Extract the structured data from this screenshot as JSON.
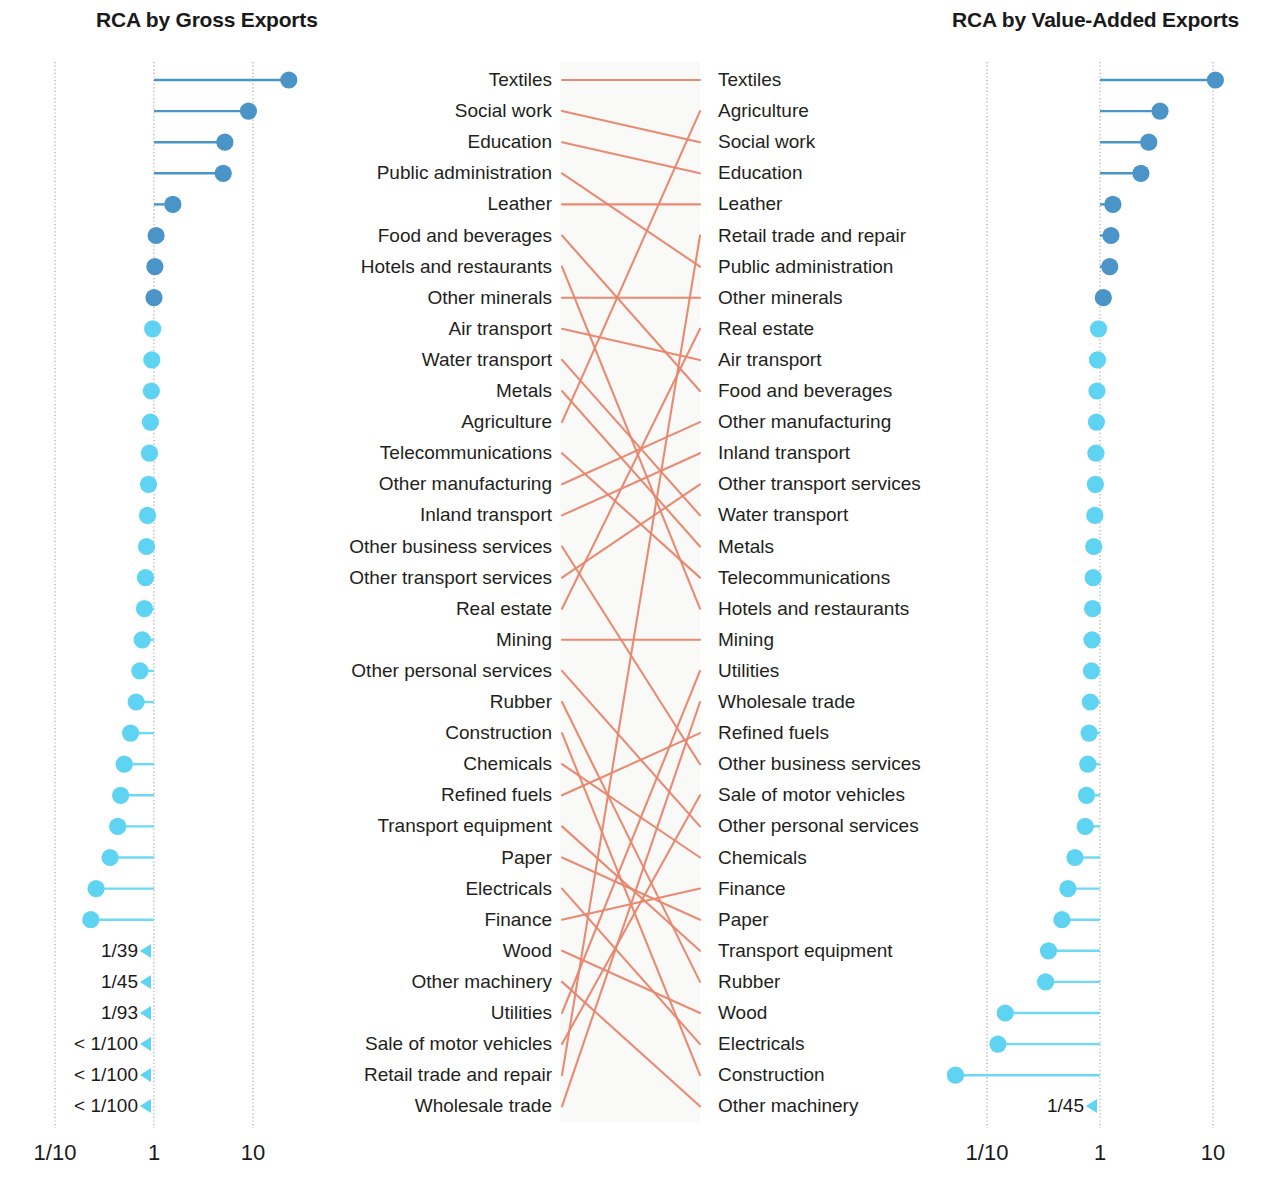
{
  "panels": {
    "left": {
      "title": "RCA by Gross Exports"
    },
    "right": {
      "title": "RCA by Value-Added Exports"
    }
  },
  "axis": {
    "ticks": [
      "1/10",
      "1",
      "10"
    ],
    "tick_values": [
      0.1,
      1,
      10
    ]
  },
  "colors": {
    "dot_high": "#4a94c8",
    "dot_low": "#5fd3f2",
    "line_high": "#4a94c8",
    "line_low": "#6fd8f5",
    "connector": "#e8856b",
    "gridline": "#9a9a9a",
    "text": "#231f20",
    "band": "#f4f4f2"
  },
  "chart_data": {
    "type": "slopegraph",
    "xlabel": "Revealed Comparative Advantage (log scale)",
    "ylabel": "",
    "xlim": [
      0.01,
      30
    ],
    "xticks": [
      0.1,
      1,
      10
    ],
    "xticklabels": [
      "1/10",
      "1",
      "10"
    ],
    "grid": true,
    "legend": "none",
    "baseline": 1,
    "off_scale_threshold": 0.01,
    "series": [
      {
        "name": "RCA by Gross Exports",
        "panel": "left",
        "points": [
          {
            "rank": 1,
            "label": "Textiles",
            "value": 23.0,
            "offscale": false,
            "high": true
          },
          {
            "rank": 2,
            "label": "Social work",
            "value": 9.0,
            "offscale": false,
            "high": true
          },
          {
            "rank": 3,
            "label": "Education",
            "value": 5.2,
            "offscale": false,
            "high": true
          },
          {
            "rank": 4,
            "label": "Public administration",
            "value": 5.0,
            "offscale": false,
            "high": true
          },
          {
            "rank": 5,
            "label": "Leather",
            "value": 1.55,
            "offscale": false,
            "high": true
          },
          {
            "rank": 6,
            "label": "Food and beverages",
            "value": 1.05,
            "offscale": false,
            "high": true
          },
          {
            "rank": 7,
            "label": "Hotels and restaurants",
            "value": 1.02,
            "offscale": false,
            "high": true
          },
          {
            "rank": 8,
            "label": "Other minerals",
            "value": 1.0,
            "offscale": false,
            "high": true
          },
          {
            "rank": 9,
            "label": "Air transport",
            "value": 0.97,
            "offscale": false,
            "high": false
          },
          {
            "rank": 10,
            "label": "Water transport",
            "value": 0.95,
            "offscale": false,
            "high": false
          },
          {
            "rank": 11,
            "label": "Metals",
            "value": 0.94,
            "offscale": false,
            "high": false
          },
          {
            "rank": 12,
            "label": "Agriculture",
            "value": 0.92,
            "offscale": false,
            "high": false
          },
          {
            "rank": 13,
            "label": "Telecommunications",
            "value": 0.9,
            "offscale": false,
            "high": false
          },
          {
            "rank": 14,
            "label": "Other manufacturing",
            "value": 0.88,
            "offscale": false,
            "high": false
          },
          {
            "rank": 15,
            "label": "Inland transport",
            "value": 0.86,
            "offscale": false,
            "high": false
          },
          {
            "rank": 16,
            "label": "Other business services",
            "value": 0.84,
            "offscale": false,
            "high": false
          },
          {
            "rank": 17,
            "label": "Other transport services",
            "value": 0.82,
            "offscale": false,
            "high": false
          },
          {
            "rank": 18,
            "label": "Real estate",
            "value": 0.8,
            "offscale": false,
            "high": false
          },
          {
            "rank": 19,
            "label": "Mining",
            "value": 0.76,
            "offscale": false,
            "high": false
          },
          {
            "rank": 20,
            "label": "Other personal services",
            "value": 0.72,
            "offscale": false,
            "high": false
          },
          {
            "rank": 21,
            "label": "Rubber",
            "value": 0.66,
            "offscale": false,
            "high": false
          },
          {
            "rank": 22,
            "label": "Construction",
            "value": 0.58,
            "offscale": false,
            "high": false
          },
          {
            "rank": 23,
            "label": "Chemicals",
            "value": 0.5,
            "offscale": false,
            "high": false
          },
          {
            "rank": 24,
            "label": "Refined fuels",
            "value": 0.46,
            "offscale": false,
            "high": false
          },
          {
            "rank": 25,
            "label": "Transport equipment",
            "value": 0.43,
            "offscale": false,
            "high": false
          },
          {
            "rank": 26,
            "label": "Paper",
            "value": 0.36,
            "offscale": false,
            "high": false
          },
          {
            "rank": 27,
            "label": "Electricals",
            "value": 0.26,
            "offscale": false,
            "high": false
          },
          {
            "rank": 28,
            "label": "Finance",
            "value": 0.23,
            "offscale": false,
            "high": false
          },
          {
            "rank": 29,
            "label": "Wood",
            "value": 0.0256,
            "offscale": true,
            "high": false,
            "offlabel": "1/39"
          },
          {
            "rank": 30,
            "label": "Other machinery",
            "value": 0.0222,
            "offscale": true,
            "high": false,
            "offlabel": "1/45"
          },
          {
            "rank": 31,
            "label": "Utilities",
            "value": 0.0108,
            "offscale": true,
            "high": false,
            "offlabel": "1/93"
          },
          {
            "rank": 32,
            "label": "Sale of motor vehicles",
            "value": 0.005,
            "offscale": true,
            "high": false,
            "offlabel": "< 1/100"
          },
          {
            "rank": 33,
            "label": "Retail trade and repair",
            "value": 0.005,
            "offscale": true,
            "high": false,
            "offlabel": "< 1/100"
          },
          {
            "rank": 34,
            "label": "Wholesale trade",
            "value": 0.005,
            "offscale": true,
            "high": false,
            "offlabel": "< 1/100"
          }
        ]
      },
      {
        "name": "RCA by Value-Added Exports",
        "panel": "right",
        "points": [
          {
            "rank": 1,
            "label": "Textiles",
            "value": 10.5,
            "offscale": false,
            "high": true
          },
          {
            "rank": 2,
            "label": "Agriculture",
            "value": 3.4,
            "offscale": false,
            "high": true
          },
          {
            "rank": 3,
            "label": "Social work",
            "value": 2.7,
            "offscale": false,
            "high": true
          },
          {
            "rank": 4,
            "label": "Education",
            "value": 2.3,
            "offscale": false,
            "high": true
          },
          {
            "rank": 5,
            "label": "Leather",
            "value": 1.3,
            "offscale": false,
            "high": true
          },
          {
            "rank": 6,
            "label": "Retail trade and repair",
            "value": 1.25,
            "offscale": false,
            "high": true
          },
          {
            "rank": 7,
            "label": "Public administration",
            "value": 1.22,
            "offscale": false,
            "high": true
          },
          {
            "rank": 8,
            "label": "Other minerals",
            "value": 1.07,
            "offscale": false,
            "high": true
          },
          {
            "rank": 9,
            "label": "Real estate",
            "value": 0.97,
            "offscale": false,
            "high": false
          },
          {
            "rank": 10,
            "label": "Air transport",
            "value": 0.95,
            "offscale": false,
            "high": false
          },
          {
            "rank": 11,
            "label": "Food and beverages",
            "value": 0.94,
            "offscale": false,
            "high": false
          },
          {
            "rank": 12,
            "label": "Other manufacturing",
            "value": 0.93,
            "offscale": false,
            "high": false
          },
          {
            "rank": 13,
            "label": "Inland transport",
            "value": 0.92,
            "offscale": false,
            "high": false
          },
          {
            "rank": 14,
            "label": "Other transport services",
            "value": 0.91,
            "offscale": false,
            "high": false
          },
          {
            "rank": 15,
            "label": "Water transport",
            "value": 0.9,
            "offscale": false,
            "high": false
          },
          {
            "rank": 16,
            "label": "Metals",
            "value": 0.88,
            "offscale": false,
            "high": false
          },
          {
            "rank": 17,
            "label": "Telecommunications",
            "value": 0.87,
            "offscale": false,
            "high": false
          },
          {
            "rank": 18,
            "label": "Hotels and restaurants",
            "value": 0.86,
            "offscale": false,
            "high": false
          },
          {
            "rank": 19,
            "label": "Mining",
            "value": 0.85,
            "offscale": false,
            "high": false
          },
          {
            "rank": 20,
            "label": "Utilities",
            "value": 0.84,
            "offscale": false,
            "high": false
          },
          {
            "rank": 21,
            "label": "Wholesale trade",
            "value": 0.82,
            "offscale": false,
            "high": false
          },
          {
            "rank": 22,
            "label": "Refined fuels",
            "value": 0.8,
            "offscale": false,
            "high": false
          },
          {
            "rank": 23,
            "label": "Other business services",
            "value": 0.78,
            "offscale": false,
            "high": false
          },
          {
            "rank": 24,
            "label": "Sale of motor vehicles",
            "value": 0.76,
            "offscale": false,
            "high": false
          },
          {
            "rank": 25,
            "label": "Other personal services",
            "value": 0.74,
            "offscale": false,
            "high": false
          },
          {
            "rank": 26,
            "label": "Chemicals",
            "value": 0.6,
            "offscale": false,
            "high": false
          },
          {
            "rank": 27,
            "label": "Finance",
            "value": 0.52,
            "offscale": false,
            "high": false
          },
          {
            "rank": 28,
            "label": "Paper",
            "value": 0.46,
            "offscale": false,
            "high": false
          },
          {
            "rank": 29,
            "label": "Transport equipment",
            "value": 0.35,
            "offscale": false,
            "high": false
          },
          {
            "rank": 30,
            "label": "Rubber",
            "value": 0.33,
            "offscale": false,
            "high": false
          },
          {
            "rank": 31,
            "label": "Wood",
            "value": 0.145,
            "offscale": false,
            "high": false
          },
          {
            "rank": 32,
            "label": "Electricals",
            "value": 0.125,
            "offscale": false,
            "high": false
          },
          {
            "rank": 33,
            "label": "Construction",
            "value": 0.0526,
            "offscale": true,
            "high": false,
            "offlabel": "1/19"
          },
          {
            "rank": 34,
            "label": "Other machinery",
            "value": 0.0222,
            "offscale": true,
            "high": false,
            "offlabel": "1/45"
          }
        ]
      }
    ]
  }
}
